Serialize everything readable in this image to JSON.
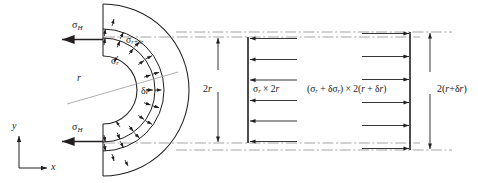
{
  "figure": {
    "background_color": "#ffffff",
    "line_color": "#231f20",
    "arrow_color": "#231f20",
    "centerline_color": "#9a9a9a",
    "width": 478,
    "height": 183
  },
  "labels": {
    "sigma_h_top": {
      "symbol": "σ",
      "subscript": "H"
    },
    "sigma_h_bottom": {
      "symbol": "σ",
      "subscript": "H"
    },
    "sigma_r": {
      "symbol": "σ",
      "subscript": "r"
    },
    "sigma_r_plus_dr": {
      "symbol": "σ",
      "subscript": "r+δr"
    },
    "radius_r": "r",
    "thickness_dr": {
      "delta": "δ",
      "variable": "r"
    },
    "dimension_left": {
      "value": "2",
      "variable": "r"
    },
    "dimension_right": {
      "prefix": "2(",
      "variable1": "r",
      "plus": "+",
      "delta": "δ",
      "variable2": "r",
      "suffix": ")"
    },
    "force_left": {
      "sigma": "σ",
      "sub": "r",
      "times": " × 2",
      "var": "r"
    },
    "force_right": {
      "open": "(",
      "sigma1": "σ",
      "sub1": "r",
      "plus": " + ",
      "delta": "δ",
      "sigma2": "σ",
      "sub2": "r",
      "close": ") × 2(",
      "var1": "r",
      "plus2": " + ",
      "delta2": "δ",
      "var2": "r",
      "close2": ")"
    },
    "axis_x": "x",
    "axis_y": "y"
  },
  "geometry": {
    "center_x": 103,
    "center_y": 90,
    "outer_radius": 86,
    "inner_radius": 34,
    "element_inner_radius": 52,
    "element_outer_radius": 61,
    "element_mid_radius": 56.5,
    "stress_arrow_count_inner": 9,
    "stress_arrow_count_outer": 9,
    "fbd_left_bar_x": 248,
    "fbd_right_bar_x": 410,
    "fbd_arrow_rows": 6,
    "dim_left_x": 218,
    "dim_left_top_y": 37,
    "dim_left_bottom_y": 143,
    "dim_right_x": 430,
    "dim_right_top_y": 32,
    "dim_right_bottom_y": 150,
    "centerline_top_y": 37,
    "centerline_bottom_y": 143,
    "centerline_outer_top_y": 32,
    "centerline_outer_bottom_y": 150
  }
}
